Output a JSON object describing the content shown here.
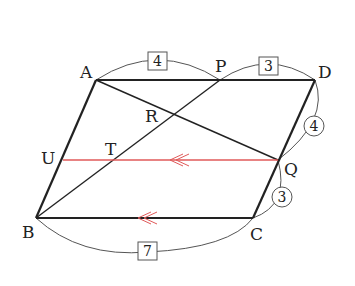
{
  "diagram": {
    "type": "geometry-parallelogram",
    "colors": {
      "main_line": "#222222",
      "arc": "#555555",
      "parallel_line": "#e05a5a",
      "background": "#ffffff"
    },
    "points": {
      "A": {
        "label": "A",
        "x": 96,
        "y": 80
      },
      "D": {
        "label": "D",
        "x": 315,
        "y": 80
      },
      "B": {
        "label": "B",
        "x": 36,
        "y": 218
      },
      "C": {
        "label": "C",
        "x": 253,
        "y": 218
      },
      "P": {
        "label": "P",
        "x": 220,
        "y": 80
      },
      "Q": {
        "label": "Q",
        "x": 278,
        "y": 160
      },
      "R": {
        "label": "R",
        "x": 176,
        "y": 113
      },
      "T": {
        "label": "T",
        "x": 115,
        "y": 160
      },
      "U": {
        "label": "U",
        "x": 63,
        "y": 160
      }
    },
    "measures": {
      "AP": {
        "value": "4",
        "style": "box"
      },
      "PD": {
        "value": "3",
        "style": "box"
      },
      "DQ": {
        "value": "4",
        "style": "circle"
      },
      "QC": {
        "value": "3",
        "style": "circle"
      },
      "BC": {
        "value": "7",
        "style": "box"
      }
    },
    "parallel_marks": {
      "UQ": "double-arrow",
      "BC": "double-arrow"
    }
  }
}
